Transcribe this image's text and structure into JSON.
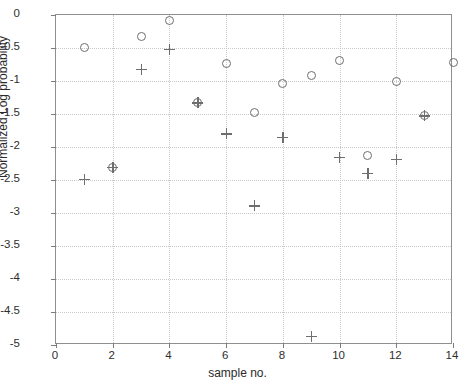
{
  "chart_data": {
    "type": "scatter",
    "title": "",
    "xlabel": "sample no.",
    "ylabel": "Normalized Log probability",
    "xlim": [
      0,
      14
    ],
    "ylim": [
      -5,
      0
    ],
    "xticks": [
      0,
      2,
      4,
      6,
      8,
      10,
      12,
      14
    ],
    "xtick_labels": [
      "0",
      "2",
      "4",
      "6",
      "8",
      "10",
      "12",
      "14"
    ],
    "yticks": [
      0,
      -0.5,
      -1,
      -1.5,
      -2,
      -2.5,
      -3,
      -3.5,
      -4,
      -4.5,
      -5
    ],
    "ytick_labels": [
      "0",
      "-0.5",
      "-1",
      "-1.5",
      "-2",
      "-2.5",
      "-3",
      "-3.5",
      "-4",
      "-4.5",
      "-5"
    ],
    "grid": true,
    "grid_style": "dotted",
    "legend": null,
    "marker_color": "#6e6e6e",
    "series": [
      {
        "name": "circle-series",
        "marker": "circle",
        "x": [
          1,
          2,
          3,
          4,
          5,
          6,
          7,
          8,
          9,
          10,
          11,
          12,
          13,
          14
        ],
        "y": [
          -0.49,
          -2.31,
          -0.33,
          -0.09,
          -1.33,
          -0.74,
          -1.47,
          -1.04,
          -0.92,
          -0.69,
          -2.13,
          -1.0,
          -1.53,
          -0.72
        ]
      },
      {
        "name": "plus-series",
        "marker": "plus",
        "x": [
          1,
          2,
          3,
          4,
          5,
          6,
          7,
          8,
          9,
          10,
          11,
          12,
          13
        ],
        "y": [
          -2.49,
          -2.31,
          -0.82,
          -0.52,
          -1.33,
          -1.8,
          -2.89,
          -1.85,
          -4.87,
          -2.16,
          -2.4,
          -2.19,
          -1.53
        ]
      }
    ]
  }
}
